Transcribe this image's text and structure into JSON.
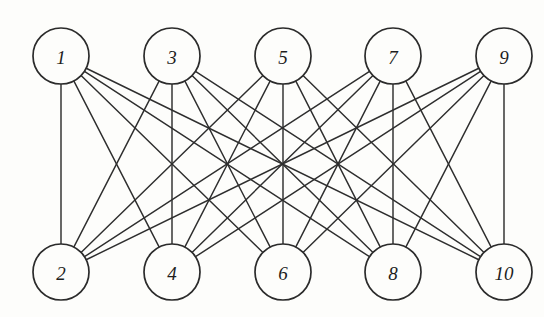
{
  "figure": {
    "kind": "bipartite-graph-diagram",
    "background_color": "#fdfdfb",
    "ink_color": "#2e2e2e",
    "node_fill": "#fdfdfb",
    "node_stroke": "#2b2b2b",
    "node_radius": 28,
    "node_stroke_width": 1.7,
    "edge_stroke_width": 1.45
  },
  "graph_data": {
    "type": "graph",
    "layout": "bipartite-two-row",
    "directed": false,
    "node_count": 10,
    "edge_count": 25,
    "degree_regular": 5,
    "top_row_label": "1 3 5 7 9",
    "bottom_row_label": "2 4 6 8 10",
    "nodes": [
      {
        "id": "n1",
        "label": "1",
        "x": 61,
        "y": 56,
        "row": "top"
      },
      {
        "id": "n3",
        "label": "3",
        "x": 172,
        "y": 56,
        "row": "top"
      },
      {
        "id": "n5",
        "label": "5",
        "x": 283,
        "y": 56,
        "row": "top"
      },
      {
        "id": "n7",
        "label": "7",
        "x": 393,
        "y": 56,
        "row": "top"
      },
      {
        "id": "n9",
        "label": "9",
        "x": 504,
        "y": 56,
        "row": "top"
      },
      {
        "id": "n2",
        "label": "2",
        "x": 61,
        "y": 272,
        "row": "bottom"
      },
      {
        "id": "n4",
        "label": "4",
        "x": 172,
        "y": 272,
        "row": "bottom"
      },
      {
        "id": "n6",
        "label": "6",
        "x": 283,
        "y": 272,
        "row": "bottom"
      },
      {
        "id": "n8",
        "label": "8",
        "x": 393,
        "y": 272,
        "row": "bottom"
      },
      {
        "id": "n10",
        "label": "10",
        "x": 504,
        "y": 272,
        "row": "bottom"
      }
    ],
    "edges": [
      {
        "from": "n1",
        "to": "n2"
      },
      {
        "from": "n1",
        "to": "n4"
      },
      {
        "from": "n1",
        "to": "n6"
      },
      {
        "from": "n1",
        "to": "n8"
      },
      {
        "from": "n1",
        "to": "n10"
      },
      {
        "from": "n3",
        "to": "n2"
      },
      {
        "from": "n3",
        "to": "n4"
      },
      {
        "from": "n3",
        "to": "n6"
      },
      {
        "from": "n3",
        "to": "n8"
      },
      {
        "from": "n3",
        "to": "n10"
      },
      {
        "from": "n5",
        "to": "n2"
      },
      {
        "from": "n5",
        "to": "n4"
      },
      {
        "from": "n5",
        "to": "n6"
      },
      {
        "from": "n5",
        "to": "n8"
      },
      {
        "from": "n5",
        "to": "n10"
      },
      {
        "from": "n7",
        "to": "n2"
      },
      {
        "from": "n7",
        "to": "n4"
      },
      {
        "from": "n7",
        "to": "n6"
      },
      {
        "from": "n7",
        "to": "n8"
      },
      {
        "from": "n7",
        "to": "n10"
      },
      {
        "from": "n9",
        "to": "n2"
      },
      {
        "from": "n9",
        "to": "n4"
      },
      {
        "from": "n9",
        "to": "n6"
      },
      {
        "from": "n9",
        "to": "n8"
      },
      {
        "from": "n9",
        "to": "n10"
      }
    ]
  }
}
